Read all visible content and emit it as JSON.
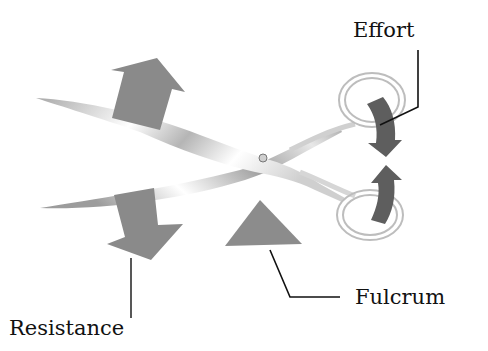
{
  "diagram": {
    "labels": {
      "effort": "Effort",
      "fulcrum": "Fulcrum",
      "resistance": "Resistance"
    },
    "icons": {
      "effort_arrows": "curved-arrow-icon",
      "resistance_arrows": "block-arrow-icon",
      "fulcrum": "triangle-icon"
    },
    "colors": {
      "background": "#ffffff",
      "arrow_light": "#8a8a8a",
      "arrow_dark": "#5e5e5e",
      "fulcrum": "#8c8c8c",
      "leader_line": "#111111",
      "blade_dark": "#9a9a9a",
      "blade_light": "#f2f2f2",
      "text": "#111111"
    }
  }
}
